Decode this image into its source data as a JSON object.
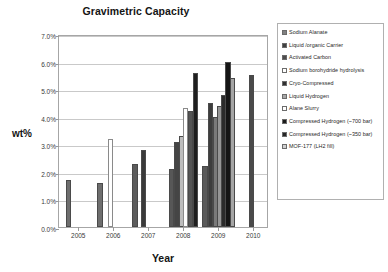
{
  "chart_data": {
    "type": "bar",
    "title": "Gravimetric Capacity",
    "xlabel": "Year",
    "ylabel": "wt%",
    "ylim": [
      0,
      7
    ],
    "ytick_labels": [
      "0.0%",
      "1.0%",
      "2.0%",
      "3.0%",
      "4.0%",
      "5.0%",
      "6.0%",
      "7.0%"
    ],
    "ytick_values": [
      0,
      1,
      2,
      3,
      4,
      5,
      6,
      7
    ],
    "xtick_labels": [
      "2005",
      "2006",
      "2007",
      "2008",
      "2009",
      "2010"
    ],
    "xtick_values": [
      2005,
      2006,
      2007,
      2008,
      2009,
      2010
    ],
    "grid": true,
    "legend_position": "right",
    "legend_entries": [
      {
        "label": "Sodium Alanate",
        "color": "#808080"
      },
      {
        "label": "Liquid /organic Carrier",
        "color": "#404040"
      },
      {
        "label": "Activated Carbon",
        "color": "#4d4d4d"
      },
      {
        "label": "Sodium borohydride hydrolysis",
        "color": "#ffffff"
      },
      {
        "label": "Cryo-Compressed",
        "color": "#303030"
      },
      {
        "label": "Liquid Hydrogen",
        "color": "#a8a8a8"
      },
      {
        "label": "Alane Slurry",
        "color": "#ffffff"
      },
      {
        "label": "Compressed Hydrogen (~700 bar)",
        "color": "#1a1a1a"
      },
      {
        "label": "Compressed Hydrogen (~350 bar)",
        "color": "#262626"
      },
      {
        "label": "MOF-177 (LH2 fill)",
        "color": "#d0d0d0"
      }
    ],
    "bars": [
      {
        "series": "Sodium Alanate",
        "x": 2004.72,
        "value": 1.7,
        "color": "#6e6e6e"
      },
      {
        "series": "Sodium Alanate",
        "x": 2005.62,
        "value": 1.6,
        "color": "#6e6e6e"
      },
      {
        "series": "Sodium borohydride hydrolysis",
        "x": 2005.92,
        "value": 3.2,
        "color": "#ffffff"
      },
      {
        "series": "Liquid /organic Carrier",
        "x": 2006.62,
        "value": 2.3,
        "color": "#5c5c5c"
      },
      {
        "series": "Cryo-Compressed",
        "x": 2006.86,
        "value": 2.8,
        "color": "#3a3a3a"
      },
      {
        "series": "Activated Carbon",
        "x": 2007.66,
        "value": 2.1,
        "color": "#575757"
      },
      {
        "series": "Liquid /organic Carrier",
        "x": 2007.82,
        "value": 3.1,
        "color": "#454545"
      },
      {
        "series": "MOF-177 (LH2 fill)",
        "x": 2007.95,
        "value": 3.3,
        "color": "#bdbdbd"
      },
      {
        "series": "Alane Slurry",
        "x": 2008.07,
        "value": 4.3,
        "color": "#ffffff"
      },
      {
        "series": "Liquid Hydrogen",
        "x": 2008.2,
        "value": 4.2,
        "color": "#555555"
      },
      {
        "series": "Compressed Hydrogen (~700 bar)",
        "x": 2008.34,
        "value": 5.6,
        "color": "#1f1f1f"
      },
      {
        "series": "Activated Carbon",
        "x": 2008.62,
        "value": 2.2,
        "color": "#5a5a5a"
      },
      {
        "series": "Cryo-Compressed",
        "x": 2008.78,
        "value": 4.5,
        "color": "#3d3d3d"
      },
      {
        "series": "Liquid Hydrogen",
        "x": 2008.92,
        "value": 4.0,
        "color": "#7a7a7a"
      },
      {
        "series": "MOF-177 (LH2 fill)",
        "x": 2009.04,
        "value": 4.4,
        "color": "#969696"
      },
      {
        "series": "Compressed Hydrogen (~350 bar)",
        "x": 2009.16,
        "value": 4.8,
        "color": "#2b2b2b"
      },
      {
        "series": "Compressed Hydrogen (~700 bar)",
        "x": 2009.28,
        "value": 6.0,
        "color": "#151515"
      },
      {
        "series": "MOF-177 (LH2 fill)",
        "x": 2009.4,
        "value": 5.4,
        "color": "#a5a5a5"
      },
      {
        "series": "Cryo-Compressed",
        "x": 2009.95,
        "value": 5.5,
        "color": "#4a4a4a"
      }
    ]
  }
}
